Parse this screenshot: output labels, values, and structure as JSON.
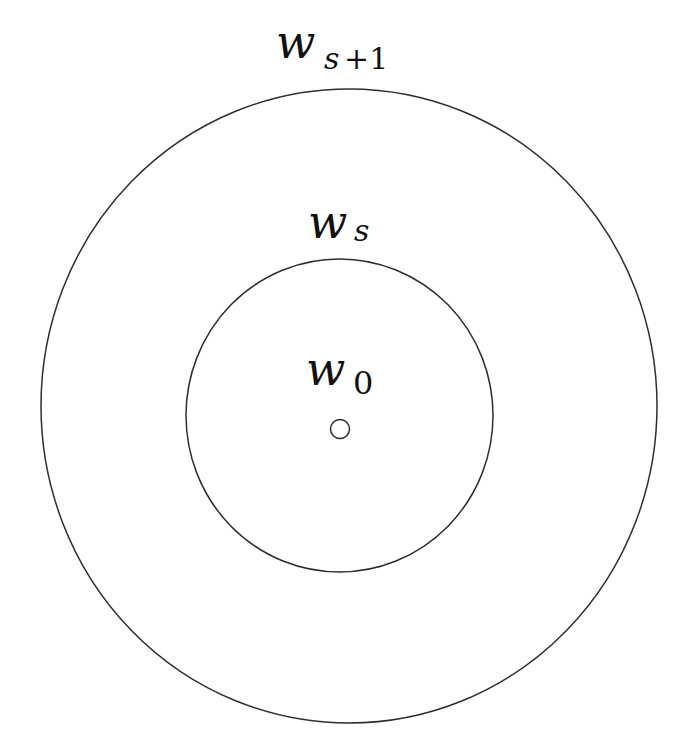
{
  "diagram": {
    "type": "concentric-circles",
    "colors": {
      "stroke": "#2e2e2e",
      "text": "#111111",
      "background": "#ffffff"
    },
    "circles": [
      {
        "id": "outer",
        "label_main": "w",
        "label_sub": "s+1",
        "label_sub_italic": "s",
        "label_sub_rest": "+1"
      },
      {
        "id": "inner",
        "label_main": "w",
        "label_sub": "s"
      },
      {
        "id": "center-point",
        "label_main": "w",
        "label_sub": "0"
      }
    ]
  }
}
